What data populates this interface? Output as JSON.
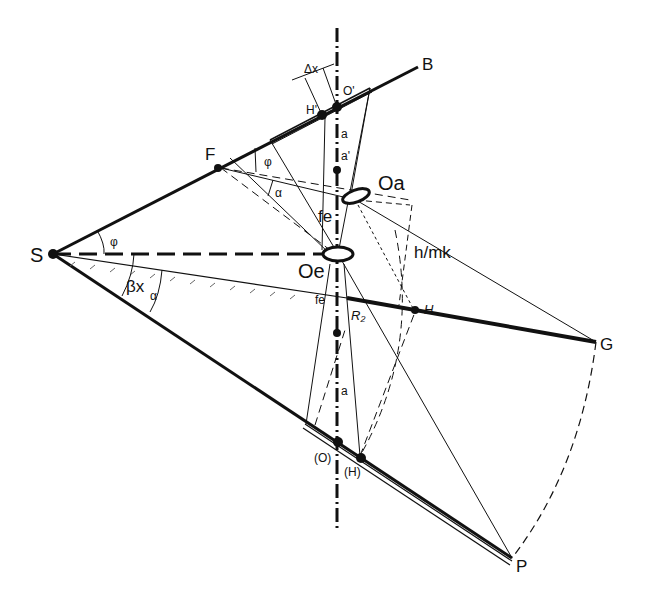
{
  "diagram": {
    "points": {
      "S": "S",
      "F": "F",
      "B": "B",
      "G": "G",
      "P": "P",
      "H": "H",
      "H_prime": "H'",
      "O_prime": "O'",
      "O_paren": "(O)",
      "H_paren": "(H)",
      "Oa": "Oa",
      "Oe": "Oe",
      "R2": "R2"
    },
    "labels": {
      "delta_x": "Δx",
      "a_upper": "a",
      "a_prime_upper": "a'",
      "a_lower": "a",
      "fe_upper": "fe",
      "fe_lower": "fe",
      "h_over_mk": "h/mk",
      "phi_S": "φ",
      "phi_F": "φ",
      "alpha_S": "α",
      "alpha_F": "α",
      "beta_x": "βx",
      "r2": "R₂"
    }
  }
}
